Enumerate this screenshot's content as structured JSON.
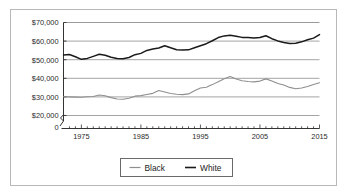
{
  "chart_data": {
    "type": "line",
    "title": "",
    "subtitle": "",
    "xlabel": "",
    "ylabel": "",
    "xlim": [
      1972,
      2015
    ],
    "ylim": [
      20000,
      70000
    ],
    "y_axis_break": true,
    "y_axis_origin_label": "0",
    "grid": true,
    "grid_orientation": "horizontal",
    "legend_position": "bottom-center",
    "ytick_labels": [
      "$70,000",
      "$60,000",
      "$50,000",
      "$40,000",
      "$30,000",
      "$20,000"
    ],
    "ytick_values": [
      70000,
      60000,
      50000,
      40000,
      30000,
      20000
    ],
    "xtick_labels": [
      "1975",
      "1985",
      "1995",
      "2005",
      "2015"
    ],
    "xtick_values": [
      1975,
      1985,
      1995,
      2005,
      2015
    ],
    "x": [
      1972,
      1973,
      1974,
      1975,
      1976,
      1977,
      1978,
      1979,
      1980,
      1981,
      1982,
      1983,
      1984,
      1985,
      1986,
      1987,
      1988,
      1989,
      1990,
      1991,
      1992,
      1993,
      1994,
      1995,
      1996,
      1997,
      1998,
      1999,
      2000,
      2001,
      2002,
      2003,
      2004,
      2005,
      2006,
      2007,
      2008,
      2009,
      2010,
      2011,
      2012,
      2013,
      2014,
      2015
    ],
    "series": [
      {
        "name": "Black",
        "color": "#8f8f8f",
        "values": [
          30100,
          30000,
          29900,
          29800,
          30100,
          30200,
          31000,
          30600,
          29600,
          28900,
          28700,
          29300,
          30400,
          30700,
          31300,
          31900,
          33400,
          32600,
          31800,
          31400,
          31200,
          31600,
          33300,
          34800,
          35200,
          36600,
          38200,
          39800,
          41000,
          39600,
          38700,
          38300,
          38100,
          38500,
          39700,
          38600,
          37200,
          36400,
          35100,
          34400,
          34800,
          35600,
          36700,
          37600
        ]
      },
      {
        "name": "White",
        "color": "#1a1a1a",
        "values": [
          52500,
          52800,
          51600,
          50200,
          50700,
          51800,
          52900,
          52400,
          51300,
          50700,
          50500,
          51200,
          52700,
          53400,
          55000,
          55700,
          56300,
          57500,
          56400,
          55400,
          55200,
          55300,
          56400,
          57500,
          58600,
          60200,
          61900,
          62800,
          63100,
          62600,
          62000,
          61900,
          61700,
          61900,
          62900,
          61300,
          60100,
          59300,
          58700,
          58900,
          59600,
          60700,
          61600,
          63500
        ]
      }
    ],
    "legend": [
      {
        "label": "Black",
        "color": "#8f8f8f"
      },
      {
        "label": "White",
        "color": "#1a1a1a"
      }
    ]
  }
}
